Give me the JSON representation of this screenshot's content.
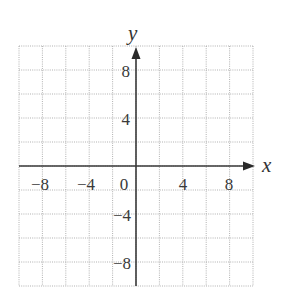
{
  "chart_data": {
    "type": "coordinate-grid",
    "title": "",
    "xlabel": "x",
    "ylabel": "y",
    "xlim": [
      -10,
      10
    ],
    "ylim": [
      -10,
      10
    ],
    "grid": true,
    "grid_step": 2,
    "grid_style": "dotted",
    "x_tick_labels": [
      "-8",
      "-4",
      "0",
      "4",
      "8"
    ],
    "x_tick_values": [
      -8,
      -4,
      0,
      4,
      8
    ],
    "y_tick_labels": [
      "8",
      "4",
      "-4",
      "-8"
    ],
    "y_tick_values": [
      8,
      4,
      -4,
      -8
    ],
    "series": []
  },
  "labels": {
    "x_axis": "x",
    "y_axis": "y",
    "x_ticks": [
      "−8",
      "−4",
      "0",
      "4",
      "8"
    ],
    "y_ticks": [
      "8",
      "4",
      "−4",
      "−8"
    ]
  },
  "colors": {
    "axis": "#3a3a3a",
    "grid": "#a8a8a8",
    "text": "#3a3a3a"
  }
}
